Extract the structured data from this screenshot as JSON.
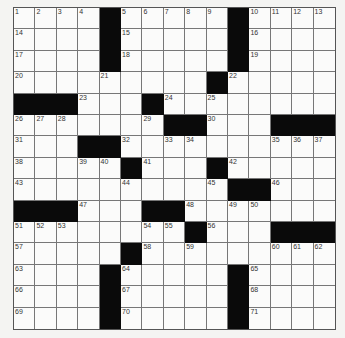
{
  "puzzle": {
    "rows": 15,
    "cols": 15,
    "colors": {
      "block": "#0a0a0a",
      "cell": "#fbfbfa",
      "line": "#777777",
      "background": "#f4f4f2"
    },
    "grid": [
      ".... ..... ....",
      ".... ..... ....",
      ".... ..... ....",
      "......... .....",
      "   ... .. .....",
      "....... ..   ",
      "...  .......   ",
      "..... ... .....",
      "..........  ...",
      "   ...  .......",
      "........ ...   ",
      "..... .........",
      ".... ..... ....",
      ".... ..... ....",
      ".... ..... ...."
    ],
    "blocks": [
      [
        0,
        4
      ],
      [
        0,
        10
      ],
      [
        1,
        4
      ],
      [
        1,
        10
      ],
      [
        2,
        4
      ],
      [
        2,
        10
      ],
      [
        3,
        9
      ],
      [
        4,
        0
      ],
      [
        4,
        1
      ],
      [
        4,
        2
      ],
      [
        4,
        6
      ],
      [
        5,
        7
      ],
      [
        5,
        8
      ],
      [
        5,
        12
      ],
      [
        5,
        13
      ],
      [
        5,
        14
      ],
      [
        6,
        3
      ],
      [
        6,
        4
      ],
      [
        7,
        5
      ],
      [
        7,
        9
      ],
      [
        8,
        10
      ],
      [
        8,
        11
      ],
      [
        9,
        0
      ],
      [
        9,
        1
      ],
      [
        9,
        2
      ],
      [
        9,
        6
      ],
      [
        9,
        7
      ],
      [
        10,
        8
      ],
      [
        10,
        12
      ],
      [
        10,
        13
      ],
      [
        10,
        14
      ],
      [
        11,
        5
      ],
      [
        12,
        4
      ],
      [
        12,
        10
      ],
      [
        13,
        4
      ],
      [
        13,
        10
      ],
      [
        14,
        4
      ],
      [
        14,
        10
      ]
    ],
    "numbers": [
      [
        0,
        0,
        "1"
      ],
      [
        0,
        1,
        "2"
      ],
      [
        0,
        2,
        "3"
      ],
      [
        0,
        3,
        "4"
      ],
      [
        0,
        5,
        "5"
      ],
      [
        0,
        6,
        "6"
      ],
      [
        0,
        7,
        "7"
      ],
      [
        0,
        8,
        "8"
      ],
      [
        0,
        9,
        "9"
      ],
      [
        0,
        11,
        "10"
      ],
      [
        0,
        12,
        "11"
      ],
      [
        0,
        13,
        "12"
      ],
      [
        0,
        14,
        "13"
      ],
      [
        1,
        0,
        "14"
      ],
      [
        1,
        5,
        "15"
      ],
      [
        1,
        11,
        "16"
      ],
      [
        2,
        0,
        "17"
      ],
      [
        2,
        5,
        "18"
      ],
      [
        2,
        11,
        "19"
      ],
      [
        3,
        0,
        "20"
      ],
      [
        3,
        4,
        "21"
      ],
      [
        3,
        10,
        "22"
      ],
      [
        4,
        3,
        "23"
      ],
      [
        4,
        7,
        "24"
      ],
      [
        4,
        9,
        "25"
      ],
      [
        5,
        0,
        "26"
      ],
      [
        5,
        1,
        "27"
      ],
      [
        5,
        2,
        "28"
      ],
      [
        5,
        6,
        "29"
      ],
      [
        5,
        9,
        "30"
      ],
      [
        6,
        0,
        "31"
      ],
      [
        6,
        5,
        "32"
      ],
      [
        6,
        7,
        "33"
      ],
      [
        6,
        8,
        "34"
      ],
      [
        6,
        12,
        "35"
      ],
      [
        6,
        13,
        "36"
      ],
      [
        6,
        14,
        "37"
      ],
      [
        7,
        0,
        "38"
      ],
      [
        7,
        3,
        "39"
      ],
      [
        7,
        4,
        "40"
      ],
      [
        7,
        6,
        "41"
      ],
      [
        7,
        10,
        "42"
      ],
      [
        8,
        0,
        "43"
      ],
      [
        8,
        5,
        "44"
      ],
      [
        8,
        9,
        "45"
      ],
      [
        8,
        12,
        "46"
      ],
      [
        9,
        3,
        "47"
      ],
      [
        9,
        8,
        "48"
      ],
      [
        9,
        10,
        "49"
      ],
      [
        9,
        11,
        "50"
      ],
      [
        10,
        0,
        "51"
      ],
      [
        10,
        1,
        "52"
      ],
      [
        10,
        2,
        "53"
      ],
      [
        10,
        6,
        "54"
      ],
      [
        10,
        7,
        "55"
      ],
      [
        10,
        9,
        "56"
      ],
      [
        11,
        0,
        "57"
      ],
      [
        11,
        6,
        "58"
      ],
      [
        11,
        8,
        "59"
      ],
      [
        11,
        12,
        "60"
      ],
      [
        11,
        13,
        "61"
      ],
      [
        11,
        14,
        "62"
      ],
      [
        12,
        0,
        "63"
      ],
      [
        12,
        5,
        "64"
      ],
      [
        12,
        11,
        "65"
      ],
      [
        13,
        0,
        "66"
      ],
      [
        13,
        5,
        "67"
      ],
      [
        13,
        11,
        "68"
      ],
      [
        14,
        0,
        "69"
      ],
      [
        14,
        5,
        "70"
      ],
      [
        14,
        11,
        "71"
      ]
    ]
  }
}
